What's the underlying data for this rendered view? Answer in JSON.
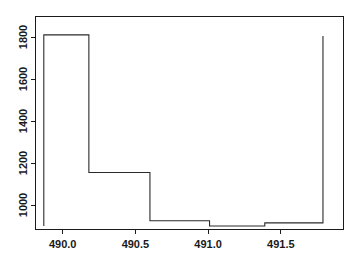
{
  "chart_data": {
    "type": "line",
    "title": "",
    "subtitle": "",
    "xlabel": "",
    "ylabel": "",
    "xlim": [
      489.82,
      491.86
    ],
    "ylim": [
      895,
      1880
    ],
    "grid": false,
    "legend": null,
    "line_style": "step-post",
    "series": [
      {
        "name": "step",
        "x": [
          489.87,
          489.87,
          490.18,
          490.18,
          490.6,
          490.6,
          491.01,
          491.01,
          491.39,
          491.39,
          491.79,
          491.79
        ],
        "y": [
          900,
          1810,
          1810,
          1155,
          1155,
          925,
          925,
          900,
          900,
          915,
          915,
          1400
        ],
        "vertices": [
          {
            "x": 489.87,
            "y": 900
          },
          {
            "x": 489.87,
            "y": 1810
          },
          {
            "x": 490.18,
            "y": 1810
          },
          {
            "x": 490.18,
            "y": 1155
          },
          {
            "x": 490.6,
            "y": 1155
          },
          {
            "x": 490.6,
            "y": 925
          },
          {
            "x": 491.01,
            "y": 925
          },
          {
            "x": 491.01,
            "y": 900
          },
          {
            "x": 491.39,
            "y": 900
          },
          {
            "x": 491.39,
            "y": 915
          },
          {
            "x": 491.79,
            "y": 915
          },
          {
            "x": 491.79,
            "y": 1400
          },
          {
            "x": 491.79,
            "y": 1805
          }
        ],
        "levels": [
          {
            "x_start": 489.87,
            "x_end": 490.18,
            "value": 1155
          },
          {
            "x_start": 490.18,
            "x_end": 490.6,
            "value": 925
          },
          {
            "x_start": 490.6,
            "x_end": 491.01,
            "value": 900
          },
          {
            "x_start": 491.01,
            "x_end": 491.39,
            "value": 915
          },
          {
            "x_start": 491.39,
            "x_end": 491.79,
            "value": 1400
          }
        ],
        "spikes": [
          {
            "x": 489.87,
            "peak": 1810
          },
          {
            "x": 491.79,
            "peak": 1805
          }
        ]
      }
    ],
    "xticks": [
      490.0,
      490.5,
      491.0,
      491.5
    ],
    "xticklabels": [
      "490.0",
      "490.5",
      "491.0",
      "491.5"
    ],
    "yticks": [
      1000,
      1200,
      1400,
      1600,
      1800
    ],
    "yticklabels": [
      "1000",
      "1200",
      "1400",
      "1600",
      "1800"
    ],
    "colors": {
      "line": "#2b2b2b",
      "axis": "#1a1a1a",
      "background": "#ffffff"
    }
  }
}
